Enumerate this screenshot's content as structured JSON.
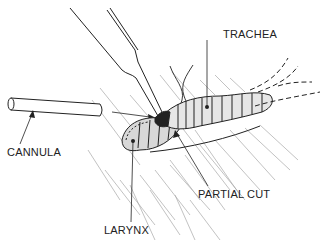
{
  "figure": {
    "labels": {
      "trachea": "TRACHEA",
      "cannula": "CANNULA",
      "partial_cut": "PARTIAL CUT",
      "larynx": "LARYNX"
    },
    "colors": {
      "ink": "#222222",
      "hatch": "#9a9a9a",
      "tissue_fill": "#d8d8d8",
      "background": "#ffffff"
    }
  }
}
